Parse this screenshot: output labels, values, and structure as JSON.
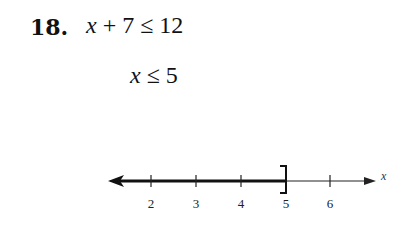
{
  "problem": {
    "number": "18.",
    "step1": {
      "var": "x",
      "rest": " + 7 ≤ 12"
    },
    "step2": {
      "var": "x",
      "rest": " ≤ 5"
    }
  },
  "number_line": {
    "axis_label": "x",
    "ticks": [
      {
        "value": "2",
        "px": 151
      },
      {
        "value": "3",
        "px": 196
      },
      {
        "value": "4",
        "px": 241
      },
      {
        "value": "5",
        "px": 286
      },
      {
        "value": "6",
        "px": 330
      }
    ],
    "solution": "x ≤ 5",
    "endpoint": {
      "value": "5",
      "type": "closed-bracket"
    },
    "shaded_direction": "left",
    "colors": {
      "line": "#111111",
      "shaded": "#111111"
    }
  }
}
